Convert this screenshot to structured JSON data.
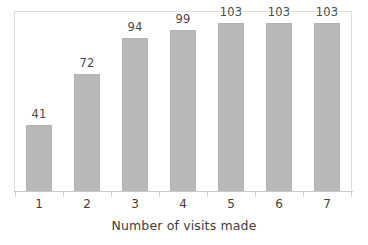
{
  "chart_data": {
    "type": "bar",
    "title": "",
    "xlabel": "Number of visits made",
    "ylabel": "",
    "categories": [
      "1",
      "2",
      "3",
      "4",
      "5",
      "6",
      "7"
    ],
    "values": [
      41,
      72,
      94,
      99,
      103,
      103,
      103
    ],
    "data_labels": [
      "41",
      "72",
      "94",
      "99",
      "103",
      "103",
      "103"
    ],
    "ylim": [
      0,
      110
    ],
    "grid": false,
    "legend": false,
    "axis_ticks_visible": true,
    "bar_color": "#b9b9b9",
    "bar_border_color": "#b2b2b2",
    "frame_color": "#dcdcdc",
    "text_color": "#3d3d3d",
    "value_label_color": "#4a4a4a"
  }
}
